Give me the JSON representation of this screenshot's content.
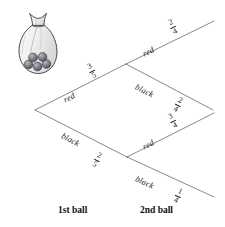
{
  "diagram": {
    "line_color": "#555555",
    "text_color": "#1a1a1a",
    "bag": {
      "icon": "bag-of-balls-icon",
      "ball_count": 5,
      "ball_color": "#6f6f78"
    },
    "captions": [
      {
        "label": "1st ball",
        "x": 58,
        "y": 205
      },
      {
        "label": "2nd ball",
        "x": 140,
        "y": 205
      }
    ],
    "nodes": {
      "root": {
        "x": 35,
        "y": 110
      },
      "red": {
        "x": 126,
        "y": 64
      },
      "black": {
        "x": 127,
        "y": 157
      }
    },
    "branches": [
      {
        "name": "first-red",
        "stage": 1,
        "outcome": "red",
        "label": "red",
        "numerator": "3",
        "denominator": "5",
        "from": {
          "x": 35,
          "y": 110
        },
        "to": {
          "x": 126,
          "y": 64
        },
        "label_x": 64,
        "label_y": 95,
        "label_rotate": -26.8,
        "frac_x": 89,
        "frac_y": 62,
        "frac_rotate": -26.8
      },
      {
        "name": "first-black",
        "stage": 1,
        "outcome": "black",
        "label": "black",
        "numerator": "2",
        "denominator": "5",
        "from": {
          "x": 35,
          "y": 110
        },
        "to": {
          "x": 127,
          "y": 157
        },
        "label_x": 62,
        "label_y": 130,
        "label_rotate": 27.1,
        "frac_x": 94,
        "frac_y": 151,
        "frac_rotate": 27.1
      },
      {
        "name": "second-red-after-red",
        "stage": 2,
        "outcome": "red",
        "label": "red",
        "numerator": "2",
        "denominator": "4",
        "from": {
          "x": 126,
          "y": 64
        },
        "to": {
          "x": 214,
          "y": 21
        },
        "label_x": 143,
        "label_y": 49,
        "label_rotate": -26.0,
        "frac_x": 170,
        "frac_y": 18,
        "frac_rotate": -26.0
      },
      {
        "name": "second-black-after-red",
        "stage": 2,
        "outcome": "black",
        "label": "black",
        "numerator": "2",
        "denominator": "4",
        "from": {
          "x": 126,
          "y": 64
        },
        "to": {
          "x": 213,
          "y": 110
        },
        "label_x": 136,
        "label_y": 81,
        "label_rotate": 27.5,
        "frac_x": 175,
        "frac_y": 96,
        "frac_rotate": 27.5
      },
      {
        "name": "second-red-after-black",
        "stage": 2,
        "outcome": "red",
        "label": "red",
        "numerator": "3",
        "denominator": "4",
        "from": {
          "x": 127,
          "y": 157
        },
        "to": {
          "x": 214,
          "y": 113
        },
        "label_x": 143,
        "label_y": 142,
        "label_rotate": -26.8,
        "frac_x": 170,
        "frac_y": 112,
        "frac_rotate": -26.8
      },
      {
        "name": "second-black-after-black",
        "stage": 2,
        "outcome": "black",
        "label": "black",
        "numerator": "1",
        "denominator": "4",
        "from": {
          "x": 127,
          "y": 157
        },
        "to": {
          "x": 214,
          "y": 197
        },
        "label_x": 136,
        "label_y": 173,
        "label_rotate": 24.8,
        "frac_x": 175,
        "frac_y": 187,
        "frac_rotate": 24.8
      }
    ]
  }
}
